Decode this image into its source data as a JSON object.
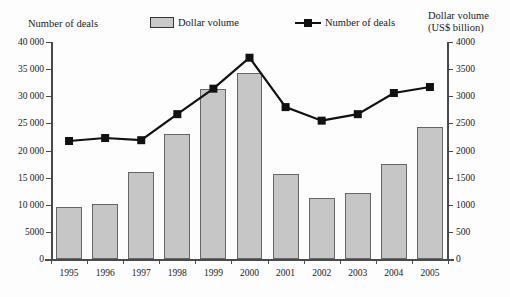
{
  "header": {
    "left_axis_title": "Number of deals",
    "right_axis_title_line1": "Dollar volume",
    "right_axis_title_line2": "(US$ billion)"
  },
  "legend": {
    "position": "top-center",
    "items": [
      {
        "label": "Dollar volume",
        "type": "bar",
        "color": "#c6c6c6",
        "icon": "bar-swatch-icon"
      },
      {
        "label": "Number of deals",
        "type": "line",
        "color": "#111111",
        "icon": "line-marker-swatch-icon"
      }
    ]
  },
  "axes": {
    "left_ticks": [
      "40 000",
      "35 000",
      "30 000",
      "25 000",
      "20 000",
      "15 000",
      "10 000",
      "5000",
      "0"
    ],
    "right_ticks": [
      "4000",
      "3500",
      "3000",
      "2500",
      "2000",
      "1500",
      "1000",
      "500",
      "0"
    ],
    "x_ticks": [
      "1995",
      "1996",
      "1997",
      "1998",
      "1999",
      "2000",
      "2001",
      "2002",
      "2003",
      "2004",
      "2005"
    ]
  },
  "chart_data": {
    "type": "bar",
    "title": "",
    "xlabel": "",
    "ylabel": "Number of deals",
    "y2label": "Dollar volume (US$ billion)",
    "grid": false,
    "legend_position": "top-center",
    "categories": [
      "1995",
      "1996",
      "1997",
      "1998",
      "1999",
      "2000",
      "2001",
      "2002",
      "2003",
      "2004",
      "2005"
    ],
    "ylim": [
      0,
      40000
    ],
    "y2lim": [
      0,
      4000
    ],
    "series": [
      {
        "name": "Dollar volume",
        "type": "bar",
        "axis": "right",
        "unit": "US$ billion",
        "color": "#c6c6c6",
        "values": [
          950,
          1020,
          1600,
          2310,
          3140,
          3430,
          1570,
          1130,
          1220,
          1750,
          2430
        ]
      },
      {
        "name": "Number of deals",
        "type": "line",
        "axis": "left",
        "unit": "deals",
        "color": "#111111",
        "values": [
          21750,
          22300,
          21900,
          26700,
          31400,
          37100,
          28000,
          25500,
          26700,
          30600,
          31700
        ]
      }
    ]
  }
}
